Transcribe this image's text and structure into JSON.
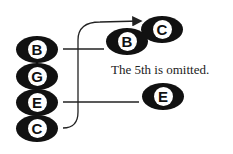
{
  "diagram": {
    "left_stack": [
      {
        "letter": "B",
        "accidental": "♭"
      },
      {
        "letter": "G",
        "accidental": ""
      },
      {
        "letter": "E",
        "accidental": ""
      },
      {
        "letter": "C",
        "accidental": ""
      }
    ],
    "right_notes": [
      {
        "letter": "C",
        "accidental": ""
      },
      {
        "letter": "B",
        "accidental": "♭"
      },
      {
        "letter": "E",
        "accidental": ""
      }
    ],
    "caption": "The 5th is omitted.",
    "colors": {
      "note_fill": "#111111",
      "line": "#222222",
      "background": "#ffffff"
    }
  }
}
